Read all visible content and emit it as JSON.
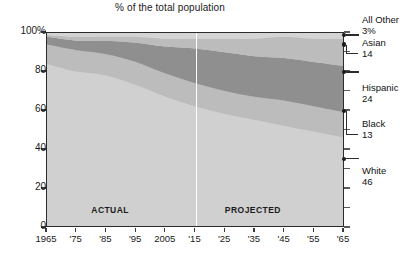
{
  "chart_data": {
    "type": "area",
    "title": "% of the total population",
    "subtitle": "",
    "xlabel": "",
    "ylabel": "",
    "xlim": [
      1965,
      2065
    ],
    "ylim": [
      0,
      100
    ],
    "grid": false,
    "stacked": true,
    "normalized_percent": true,
    "legend_position": "right-outside",
    "x": [
      1965,
      1975,
      1985,
      1995,
      2005,
      2015,
      2025,
      2035,
      2045,
      2055,
      2065
    ],
    "x_tick_labels": [
      "1965",
      "'75",
      "'85",
      "'95",
      "2005",
      "'15",
      "'25",
      "'35",
      "'45",
      "'55",
      "'65"
    ],
    "y_tick_labels": [
      "100%",
      "80",
      "60",
      "40",
      "20",
      "0"
    ],
    "y_ticks": [
      100,
      80,
      60,
      40,
      20,
      0
    ],
    "series": [
      {
        "name": "White",
        "values": [
          84,
          80,
          78,
          73,
          67,
          62,
          58,
          55,
          52,
          49,
          46
        ]
      },
      {
        "name": "Black",
        "values": [
          10,
          11,
          11,
          12,
          12,
          12,
          12,
          12,
          13,
          13,
          13
        ]
      },
      {
        "name": "Hispanic",
        "values": [
          4,
          5,
          7,
          10,
          14,
          18,
          20,
          21,
          22,
          23,
          24
        ]
      },
      {
        "name": "Asian",
        "values": [
          1,
          2,
          2,
          3,
          4,
          5,
          7,
          9,
          11,
          12,
          14
        ]
      },
      {
        "name": "All Other",
        "values": [
          1,
          2,
          2,
          2,
          3,
          3,
          3,
          3,
          2,
          3,
          3
        ]
      }
    ],
    "annotations": [
      {
        "id": "actual",
        "text": "ACTUAL",
        "x": 1988,
        "y": 9
      },
      {
        "id": "projected",
        "text": "PROJECTED",
        "x": 2036,
        "y": 9
      }
    ],
    "divider": {
      "x": 2015,
      "label": "actual/projected boundary"
    },
    "end_labels": [
      {
        "name": "All Other",
        "value": "3%",
        "at_percent": 98.5
      },
      {
        "name": "Asian",
        "value": "14",
        "at_percent": 93.5
      },
      {
        "name": "Hispanic",
        "value": "24",
        "at_percent": 79.5
      },
      {
        "name": "Black",
        "value": "13",
        "at_percent": 59.5
      },
      {
        "name": "White",
        "value": "46",
        "at_percent": 35.0
      }
    ],
    "colors": {
      "all_other": "#d4d4d4",
      "asian": "#bcbcbc",
      "hispanic": "#8f8f8f",
      "black": "#bcbcbc",
      "white": "#d0d0d0",
      "axis": "#2b2b2b",
      "divider": "#ffffff",
      "text": "#111111"
    }
  }
}
